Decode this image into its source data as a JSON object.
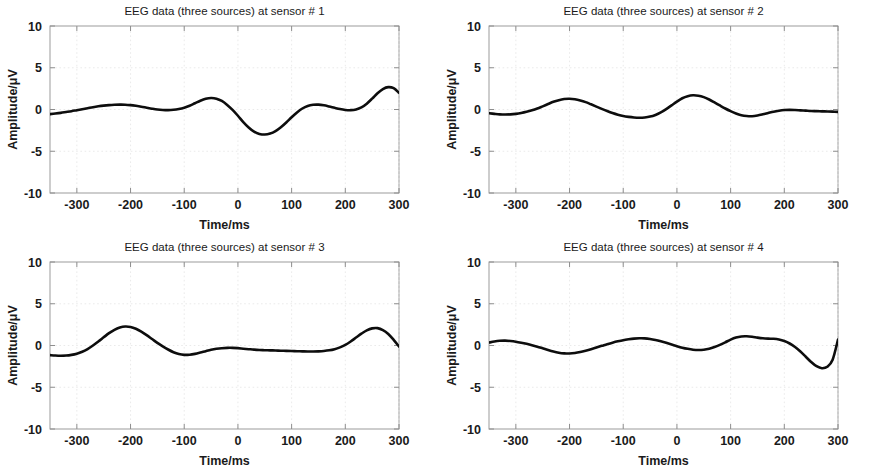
{
  "figure": {
    "width": 877,
    "height": 472,
    "background": "#ffffff",
    "line_color": "#0d0d0d",
    "frame_color": "#9b9b9b",
    "grid_color": "#e8e8e8"
  },
  "panels": [
    {
      "id": "sensor-1",
      "title": "EEG data (three sources) at sensor # 1",
      "xlabel": "Time/ms",
      "ylabel": "Amplitude/μV"
    },
    {
      "id": "sensor-2",
      "title": "EEG data (three sources) at sensor # 2",
      "xlabel": "Time/ms",
      "ylabel": "Amplitude/μV"
    },
    {
      "id": "sensor-3",
      "title": "EEG data (three sources) at sensor # 3",
      "xlabel": "Time/ms",
      "ylabel": "Amplitude/μV"
    },
    {
      "id": "sensor-4",
      "title": "EEG data (three sources) at sensor # 4",
      "xlabel": "Time/ms",
      "ylabel": "Amplitude/μV"
    }
  ],
  "axis": {
    "xticks": [
      -300,
      -200,
      -100,
      0,
      100,
      200,
      300
    ],
    "xtick_labels": [
      "-300",
      "-200",
      "-100",
      "0",
      "100",
      "200",
      "300"
    ],
    "yticks": [
      -10,
      -5,
      0,
      5,
      10
    ],
    "ytick_labels": [
      "-10",
      "-5",
      "0",
      "5",
      "10"
    ],
    "xlim": [
      -350,
      300
    ],
    "ylim": [
      -10,
      10
    ]
  },
  "chart_data": {
    "type": "line",
    "xlabel": "Time/ms",
    "ylabel": "Amplitude/μV",
    "xlim": [
      -350,
      300
    ],
    "ylim": [
      -10,
      10
    ],
    "xticks": [
      -300,
      -200,
      -100,
      0,
      100,
      200,
      300
    ],
    "yticks": [
      -10,
      -5,
      0,
      5,
      10
    ],
    "grid": true,
    "legend": "none",
    "x": [
      -350,
      -340,
      -330,
      -320,
      -310,
      -300,
      -290,
      -280,
      -270,
      -260,
      -250,
      -240,
      -230,
      -220,
      -210,
      -200,
      -190,
      -180,
      -170,
      -160,
      -150,
      -140,
      -130,
      -120,
      -110,
      -100,
      -90,
      -80,
      -70,
      -60,
      -50,
      -40,
      -30,
      -20,
      -10,
      0,
      10,
      20,
      30,
      40,
      50,
      60,
      70,
      80,
      90,
      100,
      110,
      120,
      130,
      140,
      150,
      160,
      170,
      180,
      190,
      200,
      210,
      220,
      230,
      240,
      250,
      260,
      270,
      280,
      290,
      300
    ],
    "series": [
      {
        "name": "sensor # 1",
        "panel": 0,
        "values": [
          -0.55,
          -0.48,
          -0.4,
          -0.3,
          -0.2,
          -0.08,
          0.04,
          0.16,
          0.28,
          0.38,
          0.46,
          0.52,
          0.56,
          0.58,
          0.57,
          0.52,
          0.44,
          0.34,
          0.22,
          0.1,
          0.0,
          -0.06,
          -0.08,
          -0.04,
          0.06,
          0.22,
          0.45,
          0.75,
          1.05,
          1.28,
          1.38,
          1.3,
          1.02,
          0.55,
          -0.05,
          -0.75,
          -1.5,
          -2.15,
          -2.65,
          -2.92,
          -3.0,
          -2.88,
          -2.58,
          -2.12,
          -1.55,
          -0.92,
          -0.35,
          0.12,
          0.42,
          0.56,
          0.58,
          0.5,
          0.36,
          0.2,
          0.05,
          -0.05,
          -0.08,
          0.0,
          0.25,
          0.7,
          1.3,
          1.95,
          2.45,
          2.68,
          2.55,
          2.0
        ]
      },
      {
        "name": "sensor # 2",
        "panel": 1,
        "values": [
          -0.45,
          -0.52,
          -0.58,
          -0.6,
          -0.58,
          -0.52,
          -0.42,
          -0.28,
          -0.1,
          0.12,
          0.38,
          0.65,
          0.92,
          1.12,
          1.25,
          1.28,
          1.22,
          1.08,
          0.88,
          0.62,
          0.35,
          0.08,
          -0.18,
          -0.42,
          -0.62,
          -0.78,
          -0.88,
          -0.95,
          -0.98,
          -0.95,
          -0.85,
          -0.65,
          -0.35,
          0.05,
          0.5,
          0.95,
          1.35,
          1.6,
          1.7,
          1.65,
          1.48,
          1.2,
          0.85,
          0.48,
          0.12,
          -0.2,
          -0.48,
          -0.68,
          -0.78,
          -0.8,
          -0.72,
          -0.58,
          -0.42,
          -0.26,
          -0.14,
          -0.06,
          -0.04,
          -0.06,
          -0.1,
          -0.14,
          -0.18,
          -0.2,
          -0.22,
          -0.24,
          -0.26,
          -0.28
        ]
      },
      {
        "name": "sensor # 3",
        "panel": 2,
        "values": [
          -1.15,
          -1.2,
          -1.22,
          -1.2,
          -1.12,
          -0.98,
          -0.75,
          -0.42,
          0.0,
          0.48,
          0.98,
          1.48,
          1.88,
          2.15,
          2.28,
          2.22,
          2.0,
          1.66,
          1.24,
          0.78,
          0.32,
          -0.1,
          -0.48,
          -0.8,
          -1.02,
          -1.12,
          -1.1,
          -1.0,
          -0.85,
          -0.68,
          -0.52,
          -0.4,
          -0.32,
          -0.28,
          -0.28,
          -0.32,
          -0.38,
          -0.44,
          -0.5,
          -0.54,
          -0.56,
          -0.58,
          -0.6,
          -0.62,
          -0.64,
          -0.66,
          -0.68,
          -0.7,
          -0.72,
          -0.72,
          -0.7,
          -0.66,
          -0.58,
          -0.44,
          -0.22,
          0.08,
          0.48,
          0.95,
          1.42,
          1.82,
          2.05,
          2.08,
          1.85,
          1.38,
          0.68,
          -0.12
        ]
      },
      {
        "name": "sensor # 4",
        "panel": 3,
        "values": [
          0.35,
          0.48,
          0.56,
          0.58,
          0.54,
          0.46,
          0.34,
          0.2,
          0.04,
          -0.14,
          -0.34,
          -0.54,
          -0.72,
          -0.86,
          -0.94,
          -0.96,
          -0.9,
          -0.78,
          -0.62,
          -0.44,
          -0.24,
          -0.04,
          0.16,
          0.34,
          0.5,
          0.64,
          0.74,
          0.82,
          0.86,
          0.85,
          0.78,
          0.66,
          0.5,
          0.32,
          0.12,
          -0.08,
          -0.26,
          -0.4,
          -0.5,
          -0.54,
          -0.5,
          -0.38,
          -0.18,
          0.08,
          0.38,
          0.7,
          0.95,
          1.08,
          1.1,
          1.04,
          0.94,
          0.86,
          0.82,
          0.8,
          0.72,
          0.54,
          0.24,
          -0.18,
          -0.72,
          -1.35,
          -1.98,
          -2.48,
          -2.72,
          -2.55,
          -1.7,
          0.7
        ]
      }
    ]
  }
}
